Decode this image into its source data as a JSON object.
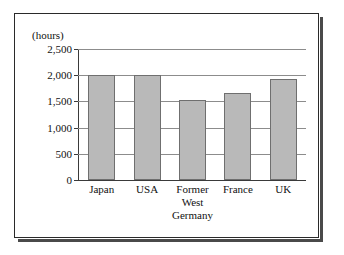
{
  "figure": {
    "y_axis_unit": "(hours)"
  },
  "chart_data": {
    "type": "bar",
    "title": "",
    "xlabel": "",
    "ylabel": "(hours)",
    "ylim": [
      0,
      2500
    ],
    "grid": true,
    "legend": "none",
    "categories": [
      "Japan",
      "Former West Germany",
      "USA",
      "France",
      "UK"
    ],
    "category_labels": [
      [
        "Japan"
      ],
      [
        "USA"
      ],
      [
        "Former",
        "West",
        "Germany"
      ],
      [
        "France"
      ],
      [
        "UK"
      ]
    ],
    "ticks": [
      "0",
      "500",
      "1,000",
      "1,500",
      "2,000",
      "2,500"
    ],
    "tick_values": [
      0,
      500,
      1000,
      1500,
      2000,
      2500
    ],
    "bars": [
      {
        "label": "Japan",
        "value": 2000
      },
      {
        "label": "USA",
        "value": 2000
      },
      {
        "label": "Former West Germany",
        "value": 1520
      },
      {
        "label": "France",
        "value": 1670
      },
      {
        "label": "UK",
        "value": 1930
      }
    ],
    "values": [
      2000,
      2000,
      1520,
      1670,
      1930
    ],
    "colors": {
      "bar_fill": "#b9b9b9",
      "bar_border": "#6f6f6f",
      "gridline": "#8c8c8c",
      "axis": "#3a3a3a",
      "frame": "#2a2a2a",
      "background": "#ffffff",
      "text": "#111111"
    }
  }
}
